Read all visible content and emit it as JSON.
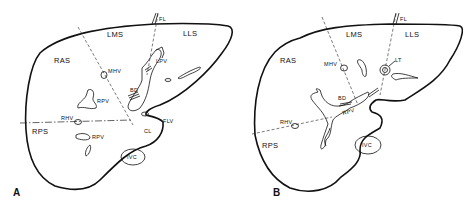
{
  "figure": {
    "panels": [
      {
        "id": "A",
        "label": "A",
        "structures": {
          "ras": "RAS",
          "lms": "LMS",
          "lls": "LLS",
          "rps": "RPS",
          "fl": "FL",
          "mhv": "MHV",
          "lpv": "LPV",
          "bd": "BD",
          "rpv_upper": "RPV",
          "rhv": "RHV",
          "rpv_lower": "RPV",
          "flv": "FLV",
          "cl": "CL",
          "ivc": "IVC"
        }
      },
      {
        "id": "B",
        "label": "B",
        "structures": {
          "ras": "RAS",
          "lms": "LMS",
          "lls": "LLS",
          "rps": "RPS",
          "fl": "FL",
          "mhv": "MHV",
          "lt": "LT",
          "bd": "BD",
          "rpv": "RPV",
          "rhv": "RHV",
          "ivc": "IVC"
        }
      }
    ],
    "colors": {
      "line": "#111111",
      "background": "#ffffff"
    }
  }
}
